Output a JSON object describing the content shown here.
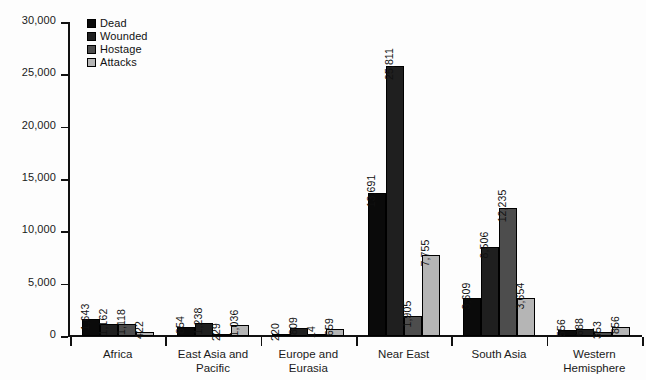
{
  "chart_data": {
    "type": "bar",
    "title": "",
    "xlabel": "",
    "ylabel": "",
    "ylim": [
      0,
      30000
    ],
    "ytick_labels": [
      "0",
      "5,000",
      "10,000",
      "15,000",
      "20,000",
      "25,000",
      "30,000"
    ],
    "ytick_values": [
      0,
      5000,
      10000,
      15000,
      20000,
      25000,
      30000
    ],
    "grid": false,
    "legend_position": "top-left",
    "categories": [
      "Africa",
      "East Asia and\nPacific",
      "Europe and\nEurasia",
      "Near East",
      "South Asia",
      "Western\nHemisphere"
    ],
    "series": [
      {
        "name": "Dead",
        "color": "#0a0a0a",
        "values": [
          1643,
          854,
          220,
          13691,
          3609,
          556
        ],
        "labels": [
          "1,643",
          "854",
          "220",
          "13,691",
          "3,609",
          "556"
        ]
      },
      {
        "name": "Wounded",
        "color": "#1f1f1f",
        "values": [
          1162,
          1238,
          809,
          25811,
          8506,
          688
        ],
        "labels": [
          "1,162",
          "1,238",
          "809",
          "25,811",
          "8,506",
          "688"
        ]
      },
      {
        "name": "Hostage",
        "color": "#4d4d4d",
        "values": [
          1118,
          229,
          14,
          1905,
          12235,
          353
        ],
        "labels": [
          "1,118",
          "229",
          "14",
          "1,905",
          "12,235",
          "353"
        ]
      },
      {
        "name": "Attacks",
        "color": "#b5b5b5",
        "values": [
          422,
          1036,
          659,
          7755,
          3654,
          856
        ],
        "labels": [
          "422",
          "1,036",
          "659",
          "7,755",
          "3,654",
          "856"
        ]
      }
    ]
  }
}
